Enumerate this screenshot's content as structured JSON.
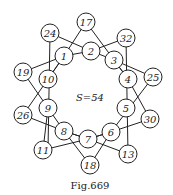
{
  "figure": {
    "caption": "Fig.669",
    "sum_label": "S=54",
    "nodes": [
      {
        "id": "17",
        "x": 86,
        "y": 22
      },
      {
        "id": "24",
        "x": 50,
        "y": 33
      },
      {
        "id": "32",
        "x": 126,
        "y": 38
      },
      {
        "id": "2",
        "x": 91,
        "y": 51
      },
      {
        "id": "1",
        "x": 64,
        "y": 56
      },
      {
        "id": "3",
        "x": 114,
        "y": 60
      },
      {
        "id": "19",
        "x": 23,
        "y": 72
      },
      {
        "id": "10",
        "x": 48,
        "y": 79
      },
      {
        "id": "4",
        "x": 128,
        "y": 79
      },
      {
        "id": "25",
        "x": 153,
        "y": 77
      },
      {
        "id": "9",
        "x": 48,
        "y": 108
      },
      {
        "id": "5",
        "x": 126,
        "y": 108
      },
      {
        "id": "26",
        "x": 23,
        "y": 115
      },
      {
        "id": "30",
        "x": 150,
        "y": 119
      },
      {
        "id": "8",
        "x": 64,
        "y": 131
      },
      {
        "id": "6",
        "x": 111,
        "y": 132
      },
      {
        "id": "7",
        "x": 88,
        "y": 139
      },
      {
        "id": "11",
        "x": 43,
        "y": 150
      },
      {
        "id": "13",
        "x": 128,
        "y": 154
      },
      {
        "id": "18",
        "x": 90,
        "y": 165
      }
    ],
    "lines": [
      [
        [
          86,
          22
        ],
        [
          64,
          56
        ],
        [
          48,
          79
        ]
      ],
      [
        [
          86,
          22
        ],
        [
          114,
          60
        ],
        [
          128,
          79
        ]
      ],
      [
        [
          50,
          33
        ],
        [
          91,
          51
        ],
        [
          114,
          60
        ]
      ],
      [
        [
          50,
          33
        ],
        [
          48,
          150
        ]
      ],
      [
        [
          126,
          38
        ],
        [
          91,
          51
        ],
        [
          64,
          56
        ]
      ],
      [
        [
          126,
          38
        ],
        [
          128,
          154
        ]
      ],
      [
        [
          23,
          72
        ],
        [
          64,
          56
        ]
      ],
      [
        [
          23,
          72
        ],
        [
          64,
          131
        ],
        [
          88,
          139
        ]
      ],
      [
        [
          153,
          77
        ],
        [
          114,
          60
        ]
      ],
      [
        [
          153,
          77
        ],
        [
          111,
          132
        ],
        [
          88,
          139
        ]
      ],
      [
        [
          23,
          115
        ],
        [
          48,
          79
        ],
        [
          64,
          56
        ]
      ],
      [
        [
          23,
          115
        ],
        [
          64,
          131
        ]
      ],
      [
        [
          150,
          119
        ],
        [
          128,
          79
        ],
        [
          114,
          60
        ]
      ],
      [
        [
          150,
          119
        ],
        [
          111,
          132
        ]
      ],
      [
        [
          43,
          150
        ],
        [
          88,
          139
        ],
        [
          111,
          132
        ]
      ],
      [
        [
          43,
          150
        ],
        [
          48,
          108
        ]
      ],
      [
        [
          128,
          154
        ],
        [
          88,
          139
        ],
        [
          64,
          131
        ]
      ],
      [
        [
          90,
          165
        ],
        [
          64,
          131
        ]
      ],
      [
        [
          90,
          165
        ],
        [
          111,
          132
        ]
      ]
    ],
    "node_radius": 9
  }
}
